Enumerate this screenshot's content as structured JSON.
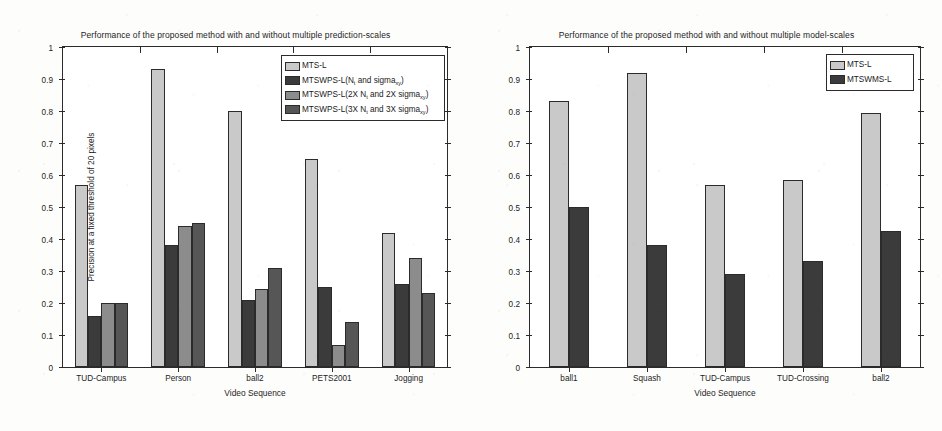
{
  "figure": {
    "background": "#fdfdfc",
    "axis_color": "#2b2b2b"
  },
  "palette": {
    "light_gray": "#c9c9c9",
    "near_black": "#3b3b3b",
    "mid_gray": "#8c8c8c",
    "dark_gray": "#565656"
  },
  "chart_data": [
    {
      "type": "bar",
      "panel": "left",
      "title": "Performance of the proposed method with and without multiple prediction-scales",
      "xlabel": "Video Sequence",
      "ylabel": "Precision at a fixed threshold of 20 pixels",
      "ylim": [
        0,
        1
      ],
      "yticks": [
        0,
        0.1,
        0.2,
        0.3,
        0.4,
        0.5,
        0.6,
        0.7,
        0.8,
        0.9,
        1
      ],
      "ytick_labels": [
        "0",
        "0.1",
        "0.2",
        "0.3",
        "0.4",
        "0.5",
        "0.6",
        "0.7",
        "0.8",
        "0.9",
        "1"
      ],
      "grid": false,
      "legend_position": "upper-right-inside",
      "categories": [
        "TUD-Campus",
        "Person",
        "ball2",
        "PETS2001",
        "Jogging"
      ],
      "series": [
        {
          "name": "MTS-L",
          "name_plain": "MTS-L",
          "color": "#c9c9c9",
          "values": [
            0.57,
            0.93,
            0.8,
            0.65,
            0.42
          ]
        },
        {
          "name": "MTSWPS-L(N_t and sigma_xy)",
          "name_prefix": "MTSWPS-L(N",
          "name_sub1": "t",
          "name_mid": " and sigma",
          "name_sub2": "xy",
          "name_suffix": ")",
          "color": "#3b3b3b",
          "values": [
            0.16,
            0.38,
            0.21,
            0.25,
            0.26
          ]
        },
        {
          "name": "MTSWPS-L(2X N_t and 2X sigma_xy)",
          "name_prefix": "MTSWPS-L(2X N",
          "name_sub1": "t",
          "name_mid": " and 2X sigma",
          "name_sub2": "xy",
          "name_suffix": ")",
          "color": "#8c8c8c",
          "values": [
            0.2,
            0.44,
            0.245,
            0.07,
            0.34
          ]
        },
        {
          "name": "MTSWPS-L(3X N_t and 3X sigma_xy)",
          "name_prefix": "MTSWPS-L(3X N",
          "name_sub1": "t",
          "name_mid": " and 3X sigma",
          "name_sub2": "xy",
          "name_suffix": ")",
          "color": "#565656",
          "values": [
            0.2,
            0.45,
            0.31,
            0.14,
            0.23
          ]
        }
      ]
    },
    {
      "type": "bar",
      "panel": "right",
      "title": "Performance of the proposed method with and without multiple model-scales",
      "xlabel": "Video Sequence",
      "ylabel": "Precision at a fixed threshold of 20 pixels",
      "ylim": [
        0,
        1
      ],
      "yticks": [
        0,
        0.1,
        0.2,
        0.3,
        0.4,
        0.5,
        0.6,
        0.7,
        0.8,
        0.9,
        1
      ],
      "ytick_labels": [
        "0",
        "0.1",
        "0.2",
        "0.3",
        "0.4",
        "0.5",
        "0.6",
        "0.7",
        "0.8",
        "0.9",
        "1"
      ],
      "grid": false,
      "legend_position": "upper-right-inside",
      "categories": [
        "ball1",
        "Squash",
        "TUD-Campus",
        "TUD-Crossing",
        "ball2"
      ],
      "series": [
        {
          "name": "MTS-L",
          "name_plain": "MTS-L",
          "color": "#c9c9c9",
          "values": [
            0.83,
            0.92,
            0.57,
            0.585,
            0.795
          ]
        },
        {
          "name": "MTSWMS-L",
          "name_plain": "MTSWMS-L",
          "color": "#3b3b3b",
          "values": [
            0.5,
            0.38,
            0.29,
            0.33,
            0.425
          ]
        }
      ]
    }
  ]
}
